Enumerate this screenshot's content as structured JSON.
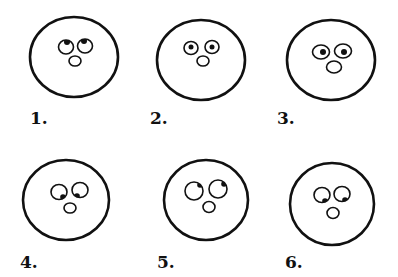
{
  "figure": {
    "stroke_color": "#111111",
    "background": "#ffffff",
    "faces": [
      {
        "label": "1.",
        "gaze": "up",
        "head": {
          "cx": 74,
          "cy": 57,
          "rx": 44,
          "ry": 40
        },
        "eyes": [
          {
            "cx": 66,
            "cy": 47,
            "rx": 7.5,
            "ry": 7,
            "pupil": {
              "cx": 67,
              "cy": 42,
              "r": 3
            }
          },
          {
            "cx": 85,
            "cy": 46,
            "rx": 7.5,
            "ry": 7,
            "pupil": {
              "cx": 84,
              "cy": 41,
              "r": 3
            }
          }
        ],
        "nose": {
          "cx": 75,
          "cy": 61,
          "rx": 6,
          "ry": 5
        },
        "label_pos": {
          "x": 30,
          "y": 110
        }
      },
      {
        "label": "2.",
        "gaze": "straight ahead",
        "head": {
          "cx": 201,
          "cy": 60,
          "rx": 44,
          "ry": 40
        },
        "eyes": [
          {
            "cx": 191,
            "cy": 48,
            "rx": 7,
            "ry": 6.5,
            "pupil": {
              "cx": 191,
              "cy": 47,
              "r": 2.5
            }
          },
          {
            "cx": 212,
            "cy": 47,
            "rx": 7,
            "ry": 6.5,
            "pupil": {
              "cx": 212,
              "cy": 47,
              "r": 2.5
            }
          }
        ],
        "nose": {
          "cx": 203,
          "cy": 61,
          "rx": 6,
          "ry": 5
        },
        "label_pos": {
          "x": 150,
          "y": 110
        }
      },
      {
        "label": "3.",
        "gaze": "straight ahead, wide",
        "head": {
          "cx": 331,
          "cy": 60,
          "rx": 44,
          "ry": 40
        },
        "eyes": [
          {
            "cx": 321,
            "cy": 52,
            "rx": 8.5,
            "ry": 7,
            "pupil": {
              "cx": 323,
              "cy": 52,
              "r": 3
            }
          },
          {
            "cx": 343,
            "cy": 51,
            "rx": 8.5,
            "ry": 7,
            "pupil": {
              "cx": 344,
              "cy": 52,
              "r": 3
            }
          }
        ],
        "nose": {
          "cx": 334,
          "cy": 67,
          "rx": 7.5,
          "ry": 6
        },
        "label_pos": {
          "x": 277,
          "y": 110
        }
      },
      {
        "label": "4.",
        "gaze": "down toward center",
        "head": {
          "cx": 66,
          "cy": 200,
          "rx": 43,
          "ry": 40
        },
        "eyes": [
          {
            "cx": 59,
            "cy": 192,
            "rx": 8,
            "ry": 7.5,
            "pupil": {
              "cx": 63,
              "cy": 197,
              "r": 2.8
            }
          },
          {
            "cx": 80,
            "cy": 190,
            "rx": 8,
            "ry": 7.5,
            "pupil": {
              "cx": 77,
              "cy": 196,
              "r": 2.8
            }
          }
        ],
        "nose": {
          "cx": 70,
          "cy": 208,
          "rx": 6,
          "ry": 5
        },
        "label_pos": {
          "x": 20,
          "y": 254
        }
      },
      {
        "label": "5.",
        "gaze": "up and right",
        "head": {
          "cx": 206,
          "cy": 200,
          "rx": 42,
          "ry": 40
        },
        "eyes": [
          {
            "cx": 194,
            "cy": 191,
            "rx": 9,
            "ry": 9,
            "pupil": {
              "cx": 200,
              "cy": 185,
              "r": 2.8
            }
          },
          {
            "cx": 218,
            "cy": 189,
            "rx": 9,
            "ry": 9,
            "pupil": {
              "cx": 224,
              "cy": 184,
              "r": 2.8
            }
          }
        ],
        "nose": {
          "cx": 209,
          "cy": 207,
          "rx": 6,
          "ry": 5.5
        },
        "label_pos": {
          "x": 157,
          "y": 254
        }
      },
      {
        "label": "6.",
        "gaze": "down and right",
        "head": {
          "cx": 332,
          "cy": 204,
          "rx": 42,
          "ry": 41
        },
        "eyes": [
          {
            "cx": 322,
            "cy": 195,
            "rx": 8,
            "ry": 7.5,
            "pupil": {
              "cx": 325,
              "cy": 201,
              "r": 2.8
            }
          },
          {
            "cx": 342,
            "cy": 194,
            "rx": 8,
            "ry": 7.5,
            "pupil": {
              "cx": 345,
              "cy": 200,
              "r": 2.8
            }
          }
        ],
        "nose": {
          "cx": 333,
          "cy": 213,
          "rx": 6,
          "ry": 5.5
        },
        "label_pos": {
          "x": 285,
          "y": 254
        }
      }
    ]
  }
}
